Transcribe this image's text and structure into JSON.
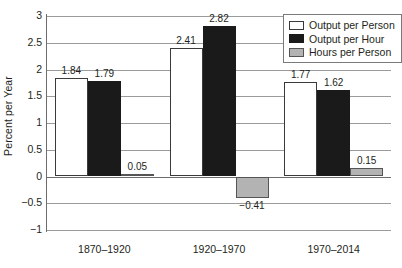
{
  "chart_data": {
    "type": "bar",
    "title": "",
    "xlabel": "",
    "ylabel": "Percent per Year",
    "ylim": [
      -1,
      3
    ],
    "ytick_labels": [
      "3",
      "2.5",
      "2",
      "1.5",
      "1",
      "0.5",
      "0",
      "−0.5",
      "−1"
    ],
    "ytick_values": [
      3,
      2.5,
      2,
      1.5,
      1,
      0.5,
      0,
      -0.5,
      -1
    ],
    "grid": true,
    "legend_position": "top-right",
    "categories": [
      "1870–1920",
      "1920–1970",
      "1970–2014"
    ],
    "series": [
      {
        "name": "Output per Person",
        "color": "#ffffff",
        "values": [
          1.84,
          2.41,
          1.77
        ],
        "labels": [
          "1.84",
          "2.41",
          "1.77"
        ]
      },
      {
        "name": "Output per Hour",
        "color": "#1a1a1a",
        "values": [
          1.79,
          2.82,
          1.62
        ],
        "labels": [
          "1.79",
          "2.82",
          "1.62"
        ]
      },
      {
        "name": "Hours per Person",
        "color": "#b3b3b3",
        "values": [
          0.05,
          -0.41,
          0.15
        ],
        "labels": [
          "0.05",
          "−0.41",
          "0.15"
        ]
      }
    ]
  },
  "legend": {
    "items": [
      {
        "label": "Output per Person",
        "swatch": "series-white"
      },
      {
        "label": "Output per Hour",
        "swatch": "series-black"
      },
      {
        "label": "Hours per Person",
        "swatch": "series-gray"
      }
    ]
  }
}
